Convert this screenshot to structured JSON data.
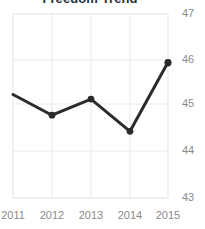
{
  "chart_data": {
    "type": "line",
    "title": "Freedom Trend",
    "xlabel": "",
    "ylabel": "",
    "categories": [
      "2011",
      "2012",
      "2013",
      "2014",
      "2015"
    ],
    "x": [
      2011,
      2012,
      2013,
      2014,
      2015
    ],
    "values": [
      45.25,
      44.8,
      45.15,
      44.45,
      45.95
    ],
    "series": [
      {
        "name": "Freedom Trend",
        "values": [
          45.25,
          44.8,
          45.15,
          44.45,
          45.95
        ]
      }
    ],
    "ylim": [
      43,
      47
    ],
    "xlim": [
      2011,
      2015
    ],
    "y_ticks": [
      43,
      44,
      45,
      46,
      47
    ],
    "y_tick_labels": [
      "43",
      "44",
      "45",
      "46",
      "47"
    ],
    "x_ticks": [
      2011,
      2012,
      2013,
      2014,
      2015
    ],
    "x_tick_labels": [
      "2011",
      "2012",
      "2013",
      "2014",
      "2015"
    ],
    "grid": true,
    "legend": false,
    "legend_position": "none",
    "y_axis_position": "right",
    "marker": "circle",
    "colors": {
      "line": "#2b2b2b",
      "marker": "#2b2b2b",
      "grid": "#e3e3e3",
      "tick_label": "#8a8a8a",
      "title": "#2f2f2f",
      "background": "#ffffff"
    }
  }
}
